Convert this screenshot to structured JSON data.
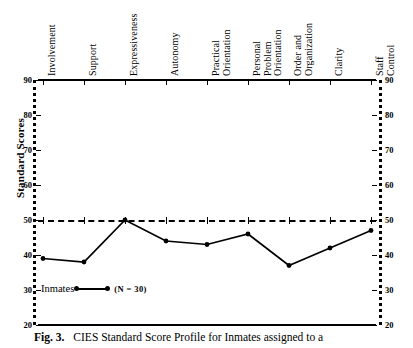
{
  "figure": {
    "caption_label": "Fig. 3.",
    "caption_text": "CIES Standard Score Profile for Inmates assigned to a"
  },
  "axes": {
    "ylabel": "Standard Scores",
    "y_ticks": [
      90,
      80,
      70,
      60,
      50,
      40,
      30,
      20
    ],
    "ylim": [
      20,
      90
    ],
    "reference_line_value": 50
  },
  "legend": {
    "series_label": "Inmates",
    "n_label": "(N = 30)"
  },
  "chart_data": {
    "type": "line",
    "title": "CIES Standard Score Profile for Inmates assigned to a",
    "xlabel": "",
    "ylabel": "Standard Scores",
    "ylim": [
      20,
      90
    ],
    "grid": false,
    "legend_position": "inside-bottom-left",
    "categories": [
      "Involvement",
      "Support",
      "Expressiveness",
      "Autonomy",
      "Practical Orientation",
      "Personal Problem Orientation",
      "Order and Organization",
      "Clarity",
      "Staff Control"
    ],
    "category_lines": [
      [
        "Involvement"
      ],
      [
        "Support"
      ],
      [
        "Expressiveness"
      ],
      [
        "Autonomy"
      ],
      [
        "Practical",
        "Orientation"
      ],
      [
        "Personal",
        "Problem",
        "Orientation"
      ],
      [
        "Order and",
        "Organization"
      ],
      [
        "Clarity"
      ],
      [
        "Staff",
        "Control"
      ]
    ],
    "series": [
      {
        "name": "Inmates",
        "n": 30,
        "values": [
          39,
          38,
          50,
          44,
          43,
          46,
          37,
          42,
          47
        ]
      }
    ],
    "annotations": [
      {
        "type": "reference-line",
        "y": 50,
        "style": "dashed"
      }
    ]
  }
}
